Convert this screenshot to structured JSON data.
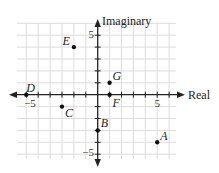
{
  "diagram": {
    "x_axis_label": "Real",
    "y_axis_label": "Imaginary",
    "tick_labels": {
      "x_neg": "−5",
      "x_pos": "5",
      "y_pos": "5",
      "y_neg": "−5"
    },
    "grid": {
      "xmin": -7,
      "xmax": 6,
      "ymin": -6,
      "ymax": 6
    },
    "colors": {
      "axis": "#222222",
      "grid": "#dcdcdc",
      "point": "#111111"
    },
    "points": [
      {
        "label": "A",
        "re": 5,
        "im": -4
      },
      {
        "label": "B",
        "re": 0,
        "im": -3
      },
      {
        "label": "C",
        "re": -3,
        "im": -1
      },
      {
        "label": "D",
        "re": -6,
        "im": 0
      },
      {
        "label": "E",
        "re": -2,
        "im": 4
      },
      {
        "label": "F",
        "re": 1,
        "im": 0
      },
      {
        "label": "G",
        "re": 1,
        "im": 1
      }
    ]
  }
}
